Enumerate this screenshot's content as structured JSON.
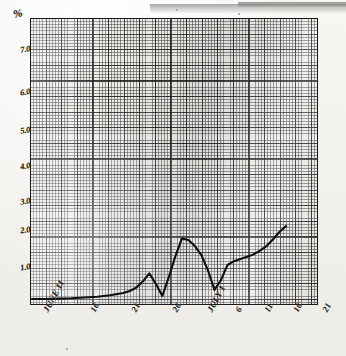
{
  "chart_data": {
    "type": "line",
    "title": "",
    "subtitle": "",
    "xlabel": "",
    "ylabel": "%",
    "grid": true,
    "legend": "none",
    "ylim": [
      0,
      7.6
    ],
    "yticks": [
      "1.0",
      "2.0",
      "3.0",
      "4.0",
      "5.0",
      "6.0",
      "7.0"
    ],
    "ytick_values": [
      1.0,
      2.0,
      3.0,
      4.0,
      5.0,
      6.0,
      7.0
    ],
    "xticks": [
      "JUNE 11",
      "16",
      "21",
      "26",
      "JULY 1",
      "6",
      "11",
      "16",
      "21"
    ],
    "xtick_values": [
      11,
      16,
      21,
      26,
      31,
      36,
      41,
      46,
      51
    ],
    "series": [
      {
        "name": "value",
        "x": [
          11,
          13,
          15,
          17,
          19,
          21,
          23,
          25,
          26,
          27,
          28,
          29,
          30,
          31,
          32,
          33,
          34,
          35,
          36,
          37,
          38,
          39,
          40,
          41,
          42,
          43,
          44,
          45,
          46,
          47,
          48,
          49,
          50
        ],
        "values": [
          0.12,
          0.12,
          0.13,
          0.14,
          0.16,
          0.18,
          0.22,
          0.28,
          0.33,
          0.42,
          0.58,
          0.8,
          0.52,
          0.2,
          0.7,
          1.25,
          1.72,
          1.68,
          1.52,
          1.28,
          0.88,
          0.36,
          0.62,
          1.02,
          1.12,
          1.18,
          1.24,
          1.3,
          1.4,
          1.52,
          1.7,
          1.9,
          2.05
        ]
      }
    ]
  },
  "axis": {
    "y_unit_label": "%",
    "y_labels": [
      "7.0",
      "6.0",
      "5.0",
      "4.0",
      "3.0",
      "2.0",
      "1.0"
    ],
    "x_labels": [
      "JUNE 11",
      "16",
      "21",
      "26",
      "JULY 1",
      "6",
      "11",
      "16",
      "21"
    ]
  }
}
